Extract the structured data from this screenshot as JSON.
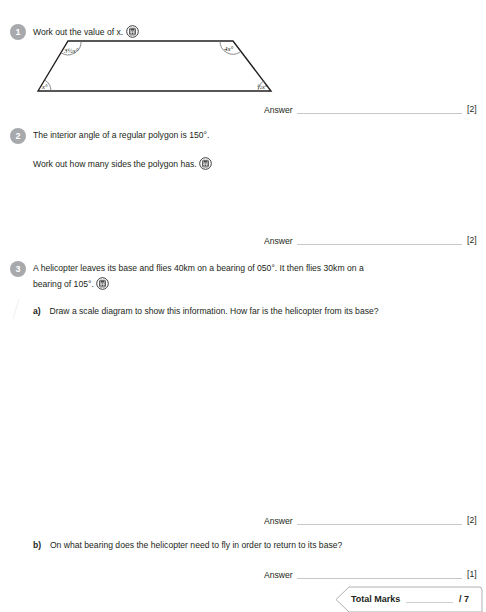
{
  "page": {
    "background_color": "#ffffff",
    "text_color": "#231f20",
    "badge_color": "#a7a9ac",
    "rule_color": "#c8c8c8"
  },
  "questions": [
    {
      "number": "1",
      "text": "Work out the value of x.",
      "icon": "calculator-icon",
      "diagram": {
        "type": "trapezium",
        "angles": {
          "top_left": "3½x°",
          "top_right": "4x°",
          "bottom_left": "x°",
          "bottom_right": "½x°"
        }
      },
      "answer_label": "Answer",
      "marks": "[2]"
    },
    {
      "number": "2",
      "line1": "The interior angle of a regular polygon is 150°.",
      "line2": "Work out how many sides the polygon has.",
      "icon": "calculator-icon",
      "answer_label": "Answer",
      "marks": "[2]"
    },
    {
      "number": "3",
      "line1": "A helicopter leaves its base and flies 40km on a bearing of 050°. It then flies 30km on a",
      "line2": "bearing of 105°.",
      "icon": "calculator-icon",
      "parts": [
        {
          "label": "a)",
          "text": "Draw a scale diagram to show this information. How far is the helicopter from its base?",
          "answer_label": "Answer",
          "marks": "[2]"
        },
        {
          "label": "b)",
          "text": "On what bearing does the helicopter need to fly in order to return to its base?",
          "answer_label": "Answer",
          "marks": "[1]"
        }
      ]
    }
  ],
  "total": {
    "label": "Total Marks",
    "out_of": "/ 7"
  }
}
